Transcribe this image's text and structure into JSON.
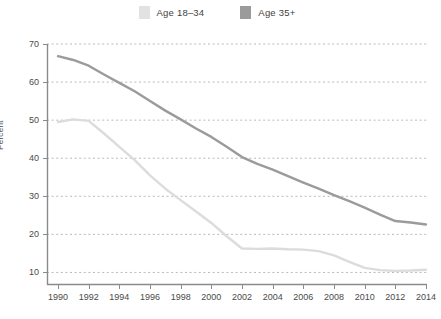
{
  "legend": {
    "position": "top-center",
    "entries": [
      {
        "label": "Age 18–34",
        "color": "#e2e2e2",
        "swatch_name": "legend-swatch-age-18-34"
      },
      {
        "label": "Age 35+",
        "color": "#9b9b9b",
        "swatch_name": "legend-swatch-age-35-plus"
      }
    ]
  },
  "chart_data": {
    "type": "line",
    "title": "",
    "subtitle": "",
    "xlabel": "",
    "ylabel": "Percent",
    "xlim": [
      1990,
      2014
    ],
    "ylim": [
      6.7,
      70
    ],
    "grid": true,
    "legend_position": "top-center",
    "ytick_values": [
      10,
      20,
      30,
      40,
      50,
      60,
      70
    ],
    "ytick_labels": [
      "10",
      "20",
      "30",
      "40",
      "50",
      "60",
      "70"
    ],
    "xtick_values": [
      1990,
      1992,
      1994,
      1996,
      1998,
      2000,
      2002,
      2004,
      2006,
      2008,
      2010,
      2012,
      2014
    ],
    "xtick_labels": [
      "1990",
      "1992",
      "1994",
      "1996",
      "1998",
      "2000",
      "2002",
      "2004",
      "2006",
      "2008",
      "2010",
      "2012",
      "2014"
    ],
    "x": [
      1990,
      1991,
      1992,
      1993,
      1994,
      1995,
      1996,
      1997,
      1998,
      1999,
      2000,
      2001,
      2002,
      2003,
      2004,
      2005,
      2006,
      2007,
      2008,
      2009,
      2010,
      2011,
      2012,
      2013,
      2014
    ],
    "series": [
      {
        "name": "Age 18–34",
        "color": "#dcdcdc",
        "values": [
          49.5,
          50.2,
          49.8,
          46.5,
          43.0,
          39.5,
          35.5,
          32.0,
          29.0,
          26.0,
          23.0,
          19.5,
          16.3,
          16.2,
          16.3,
          16.1,
          16.0,
          15.6,
          14.5,
          12.8,
          11.2,
          10.6,
          10.4,
          10.5,
          10.7
        ]
      },
      {
        "name": "Age 35+",
        "color": "#9b9b9b",
        "values": [
          66.8,
          65.8,
          64.3,
          62.0,
          59.8,
          57.6,
          55.0,
          52.5,
          50.2,
          47.8,
          45.6,
          43.0,
          40.3,
          38.5,
          37.0,
          35.3,
          33.6,
          32.0,
          30.3,
          28.7,
          27.0,
          25.2,
          23.5,
          23.1,
          22.6
        ]
      }
    ]
  },
  "axes": {
    "axis_color": "#8a8a8a",
    "grid_color": "#b9b9b9",
    "tick_text_color": "#4a4a4a"
  }
}
